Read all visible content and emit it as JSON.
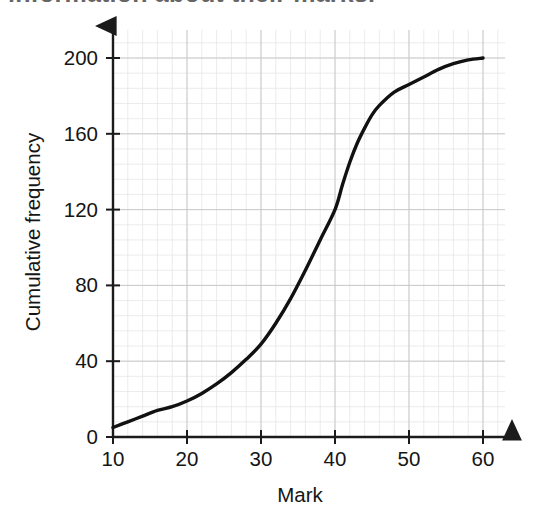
{
  "page": {
    "truncated_heading": "information about their marks."
  },
  "chart_data": {
    "type": "line",
    "title": "",
    "subtitle": "",
    "xlabel": "Mark",
    "ylabel": "Cumulative frequency",
    "xlim": [
      10,
      60
    ],
    "ylim": [
      0,
      200
    ],
    "x_ticks": [
      10,
      20,
      30,
      40,
      50,
      60
    ],
    "y_ticks": [
      0,
      40,
      80,
      120,
      160,
      200
    ],
    "x_tick_labels": [
      "10",
      "20",
      "30",
      "40",
      "50",
      "60"
    ],
    "y_tick_labels": [
      "0",
      "40",
      "80",
      "120",
      "160",
      "200"
    ],
    "x_minor_step": 2,
    "y_minor_step": 8,
    "grid": true,
    "grid_minor": true,
    "legend": false,
    "legend_position": "none",
    "axis_arrows": true,
    "curve_color": "#111111",
    "grid_major_color": "#c9c9c9",
    "grid_minor_color": "#e4e4e4",
    "axis_color": "#1b1b1b",
    "series": [
      {
        "name": "Cumulative frequency",
        "x": [
          10,
          12,
          14,
          16,
          18,
          20,
          22,
          24,
          26,
          28,
          30,
          32,
          34,
          36,
          38,
          40,
          41,
          42,
          43,
          44,
          45,
          46,
          48,
          50,
          52,
          54,
          56,
          58,
          60
        ],
        "values": [
          5,
          8,
          11,
          14,
          16,
          19,
          23,
          28,
          34,
          41,
          49,
          60,
          73,
          88,
          104,
          120,
          133,
          145,
          155,
          163,
          170,
          175,
          182,
          186,
          190,
          194,
          197,
          199,
          200
        ]
      }
    ],
    "annotations": []
  }
}
